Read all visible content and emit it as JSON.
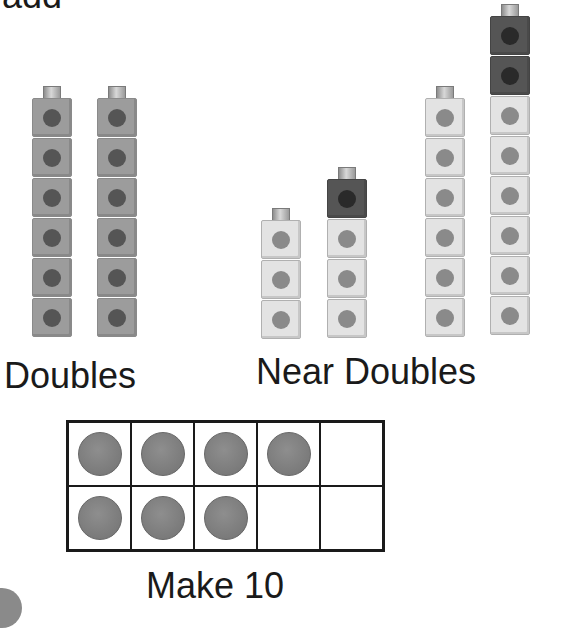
{
  "header": {
    "partial_word": "add"
  },
  "colors": {
    "doubles_cube": "#9c9c9c",
    "light_cube": "#e3e3e3",
    "dark_cube": "#555555",
    "counter": "#7e7e7e",
    "text": "#1a1a1a"
  },
  "doubles": {
    "label": "Doubles",
    "stacks": [
      {
        "cubes": [
          "gray",
          "gray",
          "gray",
          "gray",
          "gray",
          "gray"
        ],
        "count": 6
      },
      {
        "cubes": [
          "gray",
          "gray",
          "gray",
          "gray",
          "gray",
          "gray"
        ],
        "count": 6
      }
    ]
  },
  "near_doubles": {
    "label": "Near Doubles",
    "pairs": [
      {
        "left": {
          "count": 3,
          "cubes": [
            "light",
            "light",
            "light"
          ]
        },
        "right": {
          "count": 4,
          "cubes": [
            "dark",
            "light",
            "light",
            "light"
          ]
        }
      },
      {
        "left": {
          "count": 6,
          "cubes": [
            "light",
            "light",
            "light",
            "light",
            "light",
            "light"
          ]
        },
        "right": {
          "count": 8,
          "cubes": [
            "dark",
            "dark",
            "light",
            "light",
            "light",
            "light",
            "light",
            "light"
          ]
        }
      }
    ]
  },
  "make_ten": {
    "label": "Make 10",
    "rows": [
      [
        true,
        true,
        true,
        true,
        false
      ],
      [
        true,
        true,
        true,
        false,
        false
      ]
    ],
    "filled_count": 7
  }
}
